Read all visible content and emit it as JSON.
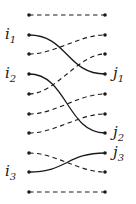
{
  "diagram": {
    "left_x": 29,
    "right_x": 105,
    "rows_y": [
      15,
      35,
      54,
      74,
      94,
      114,
      133,
      153,
      172,
      192
    ],
    "edges": [
      {
        "from_row": 0,
        "to_row": 0,
        "style": "dashed"
      },
      {
        "from_row": 1,
        "to_row": 3,
        "style": "solid"
      },
      {
        "from_row": 2,
        "to_row": 1,
        "style": "dashed"
      },
      {
        "from_row": 3,
        "to_row": 6,
        "style": "solid"
      },
      {
        "from_row": 4,
        "to_row": 2,
        "style": "dashed"
      },
      {
        "from_row": 5,
        "to_row": 4,
        "style": "dashed"
      },
      {
        "from_row": 6,
        "to_row": 5,
        "style": "dashed"
      },
      {
        "from_row": 7,
        "to_row": 8,
        "style": "dashed"
      },
      {
        "from_row": 8,
        "to_row": 7,
        "style": "solid"
      },
      {
        "from_row": 9,
        "to_row": 9,
        "style": "dashed"
      }
    ],
    "left_labels": [
      {
        "row": 1,
        "base": "i",
        "sub": "1"
      },
      {
        "row": 3,
        "base": "i",
        "sub": "2"
      },
      {
        "row": 8,
        "base": "i",
        "sub": "3"
      }
    ],
    "right_labels": [
      {
        "row": 3,
        "base": "j",
        "sub": "1"
      },
      {
        "row": 6,
        "base": "j",
        "sub": "2"
      },
      {
        "row": 7,
        "base": "j",
        "sub": "3"
      }
    ]
  }
}
